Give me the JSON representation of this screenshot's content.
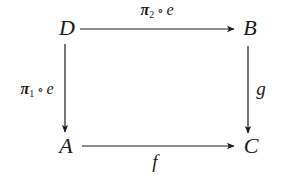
{
  "diagram": {
    "type": "commutative-square",
    "nodes": {
      "top_left": {
        "id": "D",
        "label": "D",
        "x": 67,
        "y": 29
      },
      "top_right": {
        "id": "B",
        "label": "B",
        "x": 250,
        "y": 29
      },
      "bottom_left": {
        "id": "A",
        "label": "A",
        "x": 66,
        "y": 147
      },
      "bottom_right": {
        "id": "C",
        "label": "C",
        "x": 251,
        "y": 147
      }
    },
    "edges": {
      "top": {
        "from": "D",
        "to": "B",
        "label": {
          "symbol": "π",
          "subscript": "2",
          "compose": "∘",
          "arg": "e"
        }
      },
      "left": {
        "from": "D",
        "to": "A",
        "label": {
          "symbol": "π",
          "subscript": "1",
          "compose": "∘",
          "arg": "e"
        }
      },
      "right": {
        "from": "B",
        "to": "C",
        "label": "g"
      },
      "bottom": {
        "from": "A",
        "to": "C",
        "label": "f"
      }
    },
    "colors": {
      "ink": "#1a1a1a",
      "background": "#ffffff"
    }
  }
}
